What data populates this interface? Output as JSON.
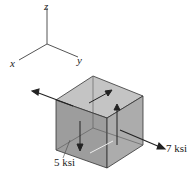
{
  "axes": {
    "z": "z",
    "x": "x",
    "y": "y"
  },
  "stresses": {
    "normal_y": "7 ksi",
    "shear": "5 ksi"
  },
  "colors": {
    "front_face": "#8c8c8c",
    "right_face": "#9a9a9a",
    "top_face": "#c4c4c4",
    "edge": "#333333"
  }
}
